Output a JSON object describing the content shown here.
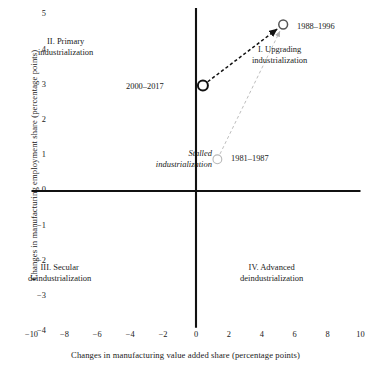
{
  "chart_data": {
    "type": "scatter",
    "title": "",
    "xlabel": "Changes in manufacturing value added share (percentage points)",
    "ylabel": "Changes in manufacturing employment share (percentage points)",
    "xlim": [
      -10,
      10
    ],
    "ylim": [
      -4,
      5
    ],
    "xticks": [
      "-10",
      "-8",
      "-6",
      "-4",
      "-2",
      "0",
      "2",
      "4",
      "6",
      "8",
      "10"
    ],
    "xtick_values": [
      -10,
      -8,
      -6,
      -4,
      -2,
      0,
      2,
      4,
      6,
      8,
      10
    ],
    "yticks": [
      "5",
      "4",
      "3",
      "2",
      "1",
      "0",
      "-1",
      "-2",
      "-3",
      "-4"
    ],
    "ytick_values": [
      5,
      4,
      3,
      2,
      1,
      0,
      -1,
      -2,
      -3,
      -4
    ],
    "grid": false,
    "legend": "none",
    "points": [
      {
        "label": "1981–1987",
        "x": 1.3,
        "y": 0.9,
        "color": "#b8b8b8",
        "marker": "open-circle"
      },
      {
        "label": "1988–1996",
        "x": 5.3,
        "y": 4.73,
        "color": "#555555",
        "marker": "open-circle"
      },
      {
        "label": "2000–2017",
        "x": 0.42,
        "y": 3.0,
        "color": "#111111",
        "marker": "open-circle"
      }
    ],
    "arrows": [
      {
        "from": "1981–1987",
        "to": "1988–1996",
        "style": "dashed",
        "color": "#b8b8b8"
      },
      {
        "from": "2000–2017",
        "to": "1988–1996",
        "style": "dashed",
        "color": "#111111"
      }
    ],
    "annotations": [
      {
        "name": "quadrant-i",
        "line1": "I. Upgrading",
        "line2": "industrialization",
        "quadrant": "I"
      },
      {
        "name": "quadrant-ii",
        "line1": "II. Primary",
        "line2": "industrialization",
        "quadrant": "II"
      },
      {
        "name": "quadrant-iii",
        "line1": "III. Secular",
        "line2": "deindustrialization",
        "quadrant": "III"
      },
      {
        "name": "quadrant-iv",
        "line1": "IV. Advanced",
        "line2": "deindustrialization",
        "quadrant": "IV"
      },
      {
        "name": "stalled",
        "line1": "Stalled",
        "line2": "industrialization",
        "style": "italic"
      }
    ],
    "axis_color": "#111111"
  },
  "axes": {
    "ylabel": "Changes in manufacturing employment share (percentage points)",
    "xlabel": "Changes in manufacturing value added share (percentage points)"
  },
  "quadrants": {
    "i": {
      "line1": "I. Upgrading",
      "line2": "industrialization"
    },
    "ii": {
      "line1": "II. Primary",
      "line2": "industrialization"
    },
    "iii": {
      "line1": "III. Secular",
      "line2": "deindustrialization"
    },
    "iv": {
      "line1": "IV. Advanced",
      "line2": "deindustrialization"
    }
  },
  "stalled": {
    "line1": "Stalled",
    "line2": "industrialization"
  },
  "point_labels": {
    "p1988": "1988–1996",
    "p1981": "1981–1987",
    "p2000": "2000–2017"
  }
}
